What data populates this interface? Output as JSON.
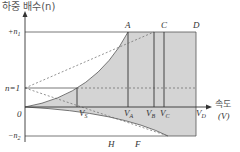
{
  "title": "하중 배수(n)",
  "axis": {
    "y_label": "하중 배수(n)",
    "x_label_line1": "속도",
    "x_label_line2": "(V)",
    "origin": "0"
  },
  "y_ticks": {
    "pos_n1": "+n",
    "pos_n1_sub": "1",
    "n_one": "n=1",
    "neg_n2": "−n",
    "neg_n2_sub": "2"
  },
  "x_ticks": {
    "vs": "V",
    "vs_sub": "S",
    "va": "V",
    "va_sub": "A",
    "vb": "V",
    "vb_sub": "B",
    "vc": "V",
    "vc_sub": "C",
    "vd": "V",
    "vd_sub": "D"
  },
  "points": {
    "A": "A",
    "C": "C",
    "D": "D",
    "H": "H",
    "F": "F"
  },
  "colors": {
    "fill": "#d4d4d4",
    "line": "#555555",
    "dash": "#666666"
  }
}
